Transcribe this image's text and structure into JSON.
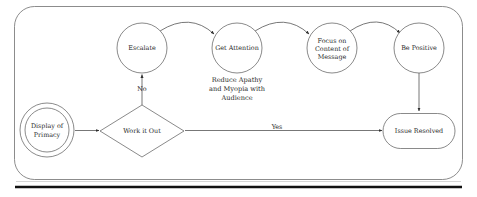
{
  "diagram": {
    "frame": {
      "name": "process-boundary"
    },
    "nodes": [
      {
        "id": "display-of-primacy",
        "shape": "double-circle",
        "lines": [
          "Display of",
          "Primacy"
        ],
        "cx": 47,
        "cy": 130,
        "r": 27,
        "r_inner": 22
      },
      {
        "id": "work-it-out",
        "shape": "diamond",
        "lines": [
          "Work it Out"
        ],
        "cx": 142,
        "cy": 131,
        "rx": 42,
        "ry": 26
      },
      {
        "id": "escalate",
        "shape": "circle",
        "lines": [
          "Escalate"
        ],
        "cx": 142,
        "cy": 48,
        "r": 25
      },
      {
        "id": "get-attention",
        "shape": "circle",
        "lines": [
          "Get Attention"
        ],
        "cx": 237,
        "cy": 48,
        "r": 25
      },
      {
        "id": "focus-on-content-of-message",
        "shape": "circle",
        "lines": [
          "Focus on",
          "Content of",
          "Message"
        ],
        "cx": 332,
        "cy": 48,
        "r": 25
      },
      {
        "id": "be-positive",
        "shape": "circle",
        "lines": [
          "Be Positive"
        ],
        "cx": 419,
        "cy": 48,
        "r": 25
      },
      {
        "id": "issue-resolved",
        "shape": "stadium",
        "lines": [
          "Issue Resolved"
        ],
        "cx": 419,
        "cy": 131,
        "w": 72,
        "h": 35
      }
    ],
    "captions": [
      {
        "id": "get-attention-caption",
        "for": "get-attention",
        "lines": [
          "Reduce Apathy",
          "and Myopia with",
          "Audience"
        ],
        "cx": 237,
        "y": 80
      }
    ],
    "edges": [
      {
        "id": "primacy-to-work-it-out",
        "from": "display-of-primacy",
        "to": "work-it-out",
        "label": ""
      },
      {
        "id": "work-it-out-to-escalate",
        "from": "work-it-out",
        "to": "escalate",
        "label": "No",
        "label_x": 142,
        "label_y": 89
      },
      {
        "id": "work-it-out-to-issue-resolved",
        "from": "work-it-out",
        "to": "issue-resolved",
        "label": "Yes",
        "label_x": 277,
        "label_y": 128
      },
      {
        "id": "escalate-to-get-attention",
        "from": "escalate",
        "to": "get-attention",
        "label": ""
      },
      {
        "id": "get-attention-to-focus",
        "from": "get-attention",
        "to": "focus-on-content-of-message",
        "label": ""
      },
      {
        "id": "focus-to-be-positive",
        "from": "focus-on-content-of-message",
        "to": "be-positive",
        "label": ""
      },
      {
        "id": "be-positive-to-issue-resolved",
        "from": "be-positive",
        "to": "issue-resolved",
        "label": ""
      }
    ],
    "colors": {
      "shape_stroke": "#575757",
      "connector": "#4a4a4a",
      "frame": "#6e6e6e",
      "text": "#2b2b2b",
      "rule": "#111111",
      "background": "#ffffff"
    }
  }
}
